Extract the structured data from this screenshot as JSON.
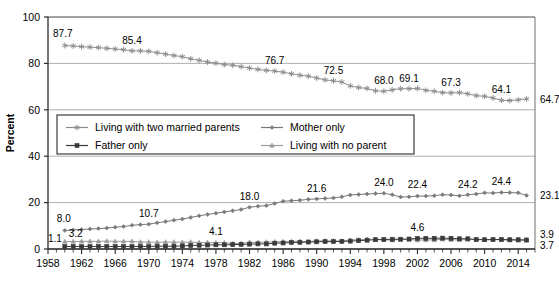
{
  "chart_data": {
    "type": "line",
    "title": "",
    "subtitle": "",
    "xlabel": "",
    "ylabel": "Percent",
    "xlim": [
      1958,
      2016
    ],
    "ylim": [
      0,
      100
    ],
    "yticks": [
      0,
      20,
      40,
      60,
      80,
      100
    ],
    "xticks": [
      1958,
      1962,
      1966,
      1970,
      1974,
      1978,
      1982,
      1986,
      1990,
      1994,
      1998,
      2002,
      2006,
      2010,
      2014
    ],
    "xtick_labels": [
      "1958",
      "1962",
      "1966",
      "1970",
      "1974",
      "1978",
      "1982",
      "1986",
      "1990",
      "1994",
      "1998",
      "2002",
      "2006",
      "2010",
      "2014"
    ],
    "ytick_labels": [
      "0",
      "20",
      "40",
      "60",
      "80",
      "100"
    ],
    "grid": "horizontal",
    "legend_position": "center-left-inside",
    "x": [
      1960,
      1961,
      1962,
      1963,
      1964,
      1965,
      1966,
      1967,
      1968,
      1969,
      1970,
      1971,
      1972,
      1973,
      1974,
      1975,
      1976,
      1977,
      1978,
      1979,
      1980,
      1981,
      1982,
      1983,
      1984,
      1985,
      1986,
      1987,
      1988,
      1989,
      1990,
      1991,
      1992,
      1993,
      1994,
      1995,
      1996,
      1997,
      1998,
      1999,
      2000,
      2001,
      2002,
      2003,
      2004,
      2005,
      2006,
      2007,
      2008,
      2009,
      2010,
      2011,
      2012,
      2013,
      2014,
      2015
    ],
    "series": [
      {
        "name": "Living with two married parents",
        "marker": "asterisk",
        "color": "#8d8d8d",
        "values": [
          87.7,
          87.5,
          87.2,
          87.0,
          86.8,
          86.5,
          86.2,
          85.9,
          85.4,
          85.4,
          85.2,
          84.6,
          84.0,
          83.4,
          82.9,
          82.0,
          81.3,
          80.6,
          80.1,
          79.5,
          79.2,
          78.6,
          78.0,
          77.4,
          77.0,
          76.7,
          76.2,
          75.5,
          74.9,
          74.5,
          73.7,
          72.9,
          72.5,
          72.0,
          70.3,
          69.6,
          69.2,
          68.2,
          68.0,
          68.6,
          69.1,
          69.1,
          69.2,
          68.4,
          68.0,
          67.4,
          67.3,
          67.4,
          66.9,
          66.1,
          65.8,
          65.1,
          64.1,
          64.0,
          64.3,
          64.7
        ],
        "labeled_points": [
          {
            "x": 1960,
            "value": "87.7"
          },
          {
            "x": 1968,
            "value": "85.4"
          },
          {
            "x": 1985,
            "value": "76.7"
          },
          {
            "x": 1992,
            "value": "72.5"
          },
          {
            "x": 1998,
            "value": "68.0"
          },
          {
            "x": 2001,
            "value": "69.1"
          },
          {
            "x": 2006,
            "value": "67.3"
          },
          {
            "x": 2012,
            "value": "64.1"
          },
          {
            "x": 2015,
            "value": "64.7"
          }
        ]
      },
      {
        "name": "Mother only",
        "marker": "diamond",
        "color": "#7a7a7a",
        "values": [
          8.0,
          8.2,
          8.4,
          8.6,
          8.8,
          9.0,
          9.4,
          9.7,
          10.2,
          10.5,
          10.7,
          11.3,
          11.8,
          12.4,
          12.9,
          13.6,
          14.3,
          14.9,
          15.4,
          16.0,
          16.5,
          17.0,
          18.0,
          18.4,
          18.7,
          19.6,
          20.6,
          20.8,
          21.0,
          21.4,
          21.6,
          21.8,
          22.0,
          22.5,
          23.3,
          23.5,
          23.7,
          23.9,
          24.0,
          23.4,
          22.4,
          22.5,
          22.8,
          22.8,
          23.0,
          23.4,
          23.3,
          22.9,
          23.4,
          23.7,
          24.2,
          24.1,
          24.4,
          24.3,
          24.2,
          23.1
        ],
        "labeled_points": [
          {
            "x": 1960,
            "value": "8.0"
          },
          {
            "x": 1970,
            "value": "10.7"
          },
          {
            "x": 1982,
            "value": "18.0"
          },
          {
            "x": 1990,
            "value": "21.6"
          },
          {
            "x": 1998,
            "value": "24.0"
          },
          {
            "x": 2002,
            "value": "22.4"
          },
          {
            "x": 2008,
            "value": "24.2"
          },
          {
            "x": 2012,
            "value": "24.4"
          },
          {
            "x": 2015,
            "value": "23.1"
          }
        ]
      },
      {
        "name": "Father only",
        "marker": "square",
        "color": "#3a3a3a",
        "values": [
          1.1,
          1.1,
          1.1,
          1.1,
          1.1,
          1.1,
          1.1,
          1.1,
          1.1,
          1.1,
          1.1,
          1.2,
          1.2,
          1.2,
          1.3,
          1.5,
          1.6,
          1.7,
          1.8,
          1.8,
          1.9,
          2.0,
          2.1,
          2.2,
          2.2,
          2.5,
          2.6,
          2.8,
          2.9,
          3.0,
          3.1,
          3.2,
          3.2,
          3.3,
          3.4,
          3.6,
          3.8,
          4.0,
          4.1,
          4.2,
          4.2,
          4.3,
          4.6,
          4.6,
          4.6,
          4.7,
          4.6,
          4.4,
          4.4,
          4.1,
          4.0,
          4.1,
          4.1,
          4.0,
          4.0,
          3.9
        ],
        "labeled_points": [
          {
            "x": 1960,
            "value": "1.1"
          },
          {
            "x": 2002,
            "value": "4.6"
          },
          {
            "x": 2015,
            "value": "3.9"
          }
        ]
      },
      {
        "name": "Living with no parent",
        "marker": "triangle",
        "color": "#9a9a9a",
        "values": [
          3.2,
          3.2,
          3.3,
          3.3,
          3.3,
          3.4,
          3.3,
          3.3,
          3.3,
          3.0,
          3.0,
          2.9,
          3.0,
          3.0,
          2.9,
          3.0,
          2.8,
          2.8,
          2.7,
          2.7,
          2.4,
          2.4,
          2.9,
          2.9,
          3.0,
          3.1,
          3.2,
          3.3,
          3.3,
          3.2,
          3.5,
          3.5,
          3.5,
          3.4,
          3.9,
          4.0,
          4.2,
          4.1,
          4.0,
          3.8,
          4.2,
          4.1,
          3.8,
          3.9,
          3.9,
          4.2,
          4.0,
          3.9,
          4.1,
          4.1,
          4.0,
          4.0,
          4.0,
          3.8,
          3.7,
          3.7
        ],
        "labeled_points": [
          {
            "x": 1960,
            "value": "3.2"
          },
          {
            "x": 1978,
            "value": "4.1"
          },
          {
            "x": 2015,
            "value": "3.7"
          }
        ]
      }
    ]
  },
  "axis": {
    "y_title": "Percent",
    "y_tick_labels": [
      "100",
      "80",
      "60",
      "40",
      "20",
      "0"
    ],
    "x_tick_labels": [
      "1958",
      "1962",
      "1966",
      "1970",
      "1974",
      "1978",
      "1982",
      "1986",
      "1990",
      "1994",
      "1998",
      "2002",
      "2006",
      "2010",
      "2014"
    ]
  },
  "legend": {
    "items": [
      {
        "label": "Living with two married parents",
        "marker": "asterisk-marker",
        "color": "#8d8d8d"
      },
      {
        "label": "Mother only",
        "marker": "diamond-marker",
        "color": "#7a7a7a"
      },
      {
        "label": "Father only",
        "marker": "square-marker",
        "color": "#3a3a3a"
      },
      {
        "label": "Living with no parent",
        "marker": "triangle-marker",
        "color": "#9a9a9a"
      }
    ]
  },
  "end_labels": {
    "two_married_parents": "64.7",
    "mother_only": "23.1",
    "father_only": "3.9",
    "no_parent": "3.7"
  }
}
